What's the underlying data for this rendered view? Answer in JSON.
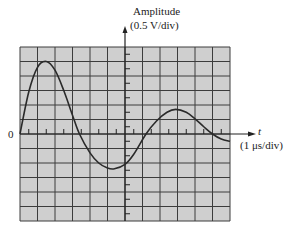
{
  "chart_data": {
    "type": "line",
    "title": "",
    "ylabel": "Amplitude",
    "ylabel_scale": "(0.5 V/div)",
    "xlabel": "t",
    "xlabel_scale": "(1 μs/div)",
    "origin_label": "0",
    "grid": true,
    "grid_divisions": {
      "x": 12,
      "y": 12
    },
    "xlim_div": [
      0,
      12
    ],
    "ylim_div": [
      -6,
      6
    ],
    "x_units_per_div": 1,
    "x_unit": "μs",
    "y_units_per_div": 0.5,
    "y_unit": "V",
    "series": [
      {
        "name": "damped oscillation",
        "x_us": [
          0,
          0.5,
          1.0,
          1.5,
          2.0,
          2.5,
          3.0,
          3.4,
          4.0,
          4.5,
          5.0,
          5.4,
          6.0,
          6.5,
          7.2,
          7.8,
          8.4,
          8.9,
          9.5,
          10.0,
          10.5,
          11.0,
          11.5,
          12.0
        ],
        "y_div": [
          0,
          2.9,
          4.6,
          5.0,
          4.4,
          3.0,
          1.3,
          0,
          -1.3,
          -2.0,
          -2.35,
          -2.4,
          -2.1,
          -1.4,
          0,
          0.9,
          1.5,
          1.7,
          1.5,
          1.05,
          0.5,
          0,
          -0.35,
          -0.5
        ]
      }
    ],
    "key_points": [
      {
        "label": "first peak",
        "t_us": 1.5,
        "amplitude_v": 2.5
      },
      {
        "label": "zero crossing",
        "t_us": 3.4,
        "amplitude_v": 0
      },
      {
        "label": "trough",
        "t_us": 5.4,
        "amplitude_v": -1.2
      },
      {
        "label": "zero crossing",
        "t_us": 7.2,
        "amplitude_v": 0
      },
      {
        "label": "second peak",
        "t_us": 8.9,
        "amplitude_v": 0.85
      },
      {
        "label": "zero crossing",
        "t_us": 11.0,
        "amplitude_v": 0
      }
    ]
  },
  "colors": {
    "grid_background": "#cfcfcf",
    "grid_line": "#3c3c3c",
    "trace": "#2a2a2a",
    "axis": "#222222"
  }
}
